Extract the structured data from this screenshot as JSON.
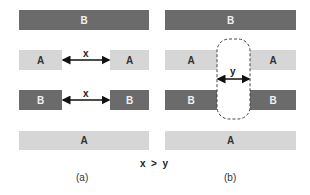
{
  "colors": {
    "B": "#6b6b6b",
    "A": "#d6d6d6"
  },
  "panel_a": {
    "caption": "(a)",
    "top_bar": "B",
    "row1": {
      "left": "A",
      "right": "A",
      "gap_label": "x"
    },
    "row2": {
      "left": "B",
      "right": "B",
      "gap_label": "x"
    },
    "bottom_bar": "A"
  },
  "panel_b": {
    "caption": "(b)",
    "top_bar": "B",
    "row1": {
      "left": "A",
      "right": "A"
    },
    "row2": {
      "left": "B",
      "right": "B"
    },
    "gap_label": "y",
    "bottom_bar": "A"
  },
  "relation": "x  >  y"
}
